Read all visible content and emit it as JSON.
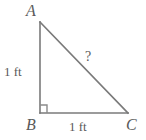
{
  "figure": {
    "type": "right-triangle-diagram",
    "background_color": "#ffffff",
    "stroke_color": "#7a7a7a",
    "text_color": "#5a5a5a"
  },
  "vertices": {
    "a": "A",
    "b": "B",
    "c": "C"
  },
  "sides": {
    "left_leg": "1 ft",
    "bottom_leg": "1 ft",
    "hypotenuse": "?"
  },
  "markers": {
    "right_angle": "right-angle-square"
  },
  "geometry": {
    "a_point": [
      40,
      22
    ],
    "b_point": [
      40,
      113
    ],
    "c_point": [
      128,
      113
    ],
    "right_angle_square": [
      38,
      105,
      8,
      8
    ]
  }
}
